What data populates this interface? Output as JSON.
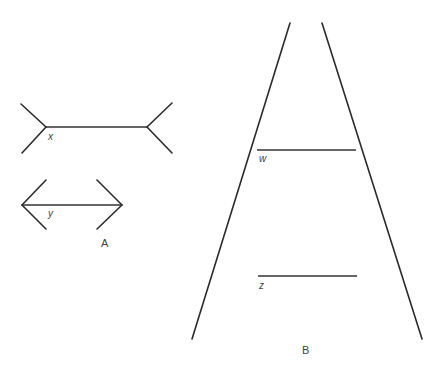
{
  "diagram": {
    "colors": {
      "line": "#2b2b2b",
      "label": "#444444",
      "background": "#ffffff"
    },
    "figure_a": {
      "caption": "A",
      "upper_figure": {
        "label": "x",
        "shaft": [
          [
            46,
            127
          ],
          [
            147,
            127
          ]
        ],
        "fins": [
          [
            [
              21,
              104
            ],
            [
              46,
              127
            ]
          ],
          [
            [
              22,
              153
            ],
            [
              46,
              127
            ]
          ],
          [
            [
              172,
              103
            ],
            [
              147,
              127
            ]
          ],
          [
            [
              172,
              153
            ],
            [
              147,
              127
            ]
          ]
        ],
        "fin_style": "outward (tails)"
      },
      "lower_figure": {
        "label": "y",
        "shaft": [
          [
            22,
            205
          ],
          [
            122,
            205
          ]
        ],
        "fins": [
          [
            [
              46,
              180
            ],
            [
              22,
              205
            ]
          ],
          [
            [
              46,
              229
            ],
            [
              22,
              205
            ]
          ],
          [
            [
              97,
              180
            ],
            [
              122,
              205
            ]
          ],
          [
            [
              97,
              229
            ],
            [
              122,
              205
            ]
          ]
        ],
        "fin_style": "inward (arrowheads)"
      }
    },
    "figure_b": {
      "caption": "B",
      "rails": [
        [
          [
            290,
            23
          ],
          [
            192,
            339
          ]
        ],
        [
          [
            322,
            23
          ],
          [
            422,
            339
          ]
        ]
      ],
      "segments": [
        {
          "label": "w",
          "from": [
            257,
            150
          ],
          "to": [
            356,
            150
          ]
        },
        {
          "label": "z",
          "from": [
            258,
            276
          ],
          "to": [
            357,
            276
          ]
        }
      ]
    }
  },
  "labels": {
    "x": "x",
    "y": "y",
    "w": "w",
    "z": "z",
    "A": "A",
    "B": "B"
  }
}
